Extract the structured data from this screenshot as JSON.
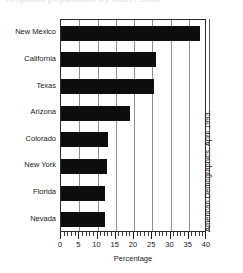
{
  "title_strip": "Hispanic population by state, 1990",
  "source_note": "American Demographics, April 1993.",
  "chart_data": {
    "type": "bar",
    "orientation": "horizontal",
    "title": "",
    "xlabel": "Percentage",
    "ylabel": "",
    "categories": [
      "Nevada",
      "Florida",
      "New York",
      "Colorado",
      "Arizona",
      "Texas",
      "California",
      "New Mexico"
    ],
    "values": [
      12,
      12,
      12.5,
      13,
      19,
      25.5,
      26,
      38
    ],
    "xlim": [
      0,
      40
    ],
    "xticks": [
      0,
      5,
      10,
      15,
      20,
      25,
      30,
      35,
      40
    ],
    "xticklabels": [
      "0",
      "5",
      "10",
      "15",
      "20",
      "25",
      "30",
      "35",
      "40"
    ],
    "minor_tick_interval": 1,
    "grid": "vertical",
    "legend": "none",
    "bar_color": "#0d0d0d",
    "grid_color": "#8c8c92",
    "axis_color": "#2b2b2b"
  }
}
